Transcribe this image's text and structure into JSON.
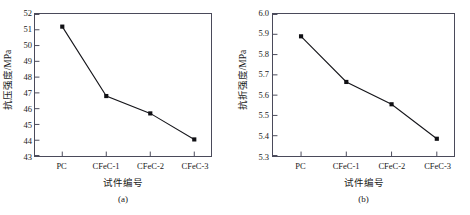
{
  "figure": {
    "panels": [
      {
        "id": "a",
        "caption": "(a)",
        "ylabel": "抗压强度/MPa",
        "xlabel": "试件编号",
        "yticks": [
          "43",
          "44",
          "45",
          "46",
          "47",
          "48",
          "49",
          "50",
          "51",
          "52"
        ],
        "xticks": [
          "PC",
          "CFeC-1",
          "CFeC-2",
          "CFeC-3"
        ]
      },
      {
        "id": "b",
        "caption": "(b)",
        "ylabel": "抗折强度/MPa",
        "xlabel": "试件编号",
        "yticks": [
          "5.3",
          "5.4",
          "5.5",
          "5.6",
          "5.7",
          "5.8",
          "5.9",
          "6.0"
        ],
        "xticks": [
          "PC",
          "CFeC-1",
          "CFeC-2",
          "CFeC-3"
        ]
      }
    ]
  },
  "chart_data": [
    {
      "type": "line",
      "panel": "a",
      "title": "",
      "xlabel": "试件编号",
      "ylabel": "抗压强度/MPa",
      "categories": [
        "PC",
        "CFeC-1",
        "CFeC-2",
        "CFeC-3"
      ],
      "values": [
        51.2,
        46.8,
        45.7,
        44.05
      ],
      "ylim": [
        43,
        52
      ],
      "ytick_step": 1,
      "grid": false,
      "legend": null,
      "marker": "square",
      "marker_color": "#101014",
      "line_color": "#15151a"
    },
    {
      "type": "line",
      "panel": "b",
      "title": "",
      "xlabel": "试件编号",
      "ylabel": "抗折强度/MPa",
      "categories": [
        "PC",
        "CFeC-1",
        "CFeC-2",
        "CFeC-3"
      ],
      "values": [
        5.89,
        5.665,
        5.555,
        5.385
      ],
      "ylim": [
        5.3,
        6.0
      ],
      "ytick_step": 0.1,
      "grid": false,
      "legend": null,
      "marker": "square",
      "marker_color": "#101014",
      "line_color": "#15151a"
    }
  ]
}
